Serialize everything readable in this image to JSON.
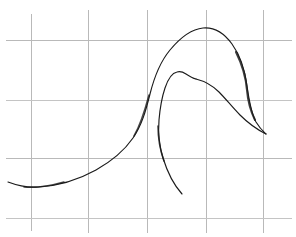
{
  "image": {
    "title": "Hand-drawn swan contour sketch on grid paper",
    "width": 296,
    "height": 237,
    "background_color": "#ffffff",
    "subject": "swan",
    "medium": "pen-line-drawing"
  },
  "grid": {
    "name": "graph-paper-grid",
    "line_color": "#b9b9b9",
    "vertical_x": [
      31,
      88,
      147,
      206,
      263
    ],
    "horizontal_y": [
      40,
      100,
      158,
      218
    ],
    "cell_width": 58,
    "cell_height": 59
  },
  "strokes": {
    "outer_contour": {
      "name": "swan-body-outline",
      "description": "Long continuous line: tail at left, rising back, arched head, down the beak to the tip, then back up under the jaw",
      "color": "#1b1b1b",
      "path": "M 8 182 C 16 185 26 188 38 187 C 58 186 78 180 96 170 C 112 161 124 151 133 138 C 142 125 146 110 150 94 C 154 78 160 62 170 50 C 180 38 192 29 203 28 C 214 27 224 33 232 44 C 240 55 245 70 247 86 C 249 100 251 113 256 122 C 261 130 264 132 266 134"
    },
    "beak_underside": {
      "name": "swan-beak-underside",
      "description": "Lower edge of the beak running from the tip back up to the jaw",
      "color": "#1b1b1b",
      "path": "M 266 134 C 258 130 248 123 240 115 C 232 107 226 99 219 92 C 212 85 204 81 196 79"
    },
    "inner_contour": {
      "name": "swan-neck-and-breast-line",
      "description": "Inner line: from the jaw over the head crest, down the front of the neck, ending in the breast",
      "color": "#1b1b1b",
      "path": "M 196 79 C 192 78 189 76 186 74 C 183 72 180 71 177 72 C 172 73 168 79 165 88 C 162 97 160 108 159 120 C 158 132 159 145 163 158 C 167 171 173 184 182 194"
    }
  },
  "labels": {
    "none_visible": ""
  }
}
